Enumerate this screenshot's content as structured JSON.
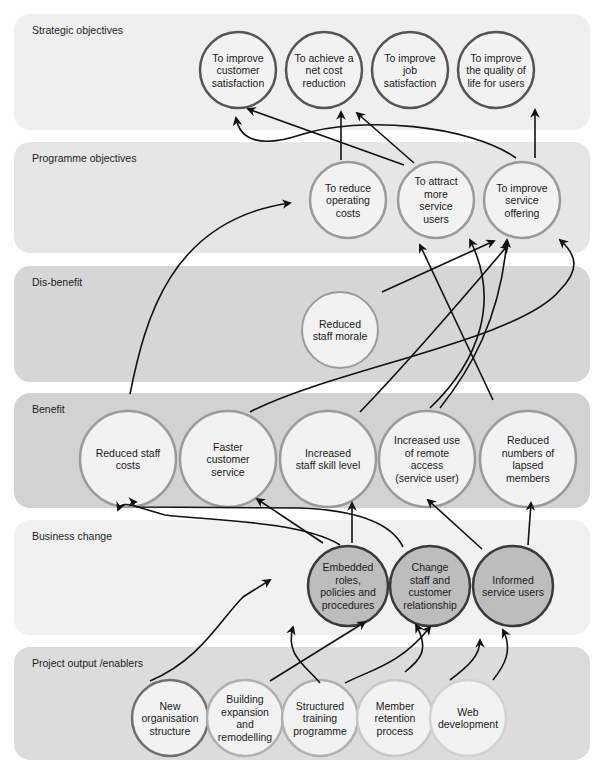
{
  "diagram": {
    "type": "benefits-dependency-network",
    "bands": [
      {
        "id": "strategic",
        "label": "Strategic objectives",
        "y": 14,
        "h": 116,
        "fill": "#efefef"
      },
      {
        "id": "programme",
        "label": "Programme objectives",
        "y": 142,
        "h": 111,
        "fill": "#e6e6e6"
      },
      {
        "id": "disbenefit",
        "label": "Dis-benefit",
        "y": 266,
        "h": 116,
        "fill": "#d6d6d6"
      },
      {
        "id": "benefit",
        "label": "Benefit",
        "y": 393,
        "h": 115,
        "fill": "#d2d2d2"
      },
      {
        "id": "business",
        "label": "Business change",
        "y": 520,
        "h": 115,
        "fill": "#f1f1f1"
      },
      {
        "id": "project",
        "label": "Project output /enablers",
        "y": 647,
        "h": 113,
        "fill": "#dcdcdc"
      }
    ],
    "nodes": [
      {
        "id": "s1",
        "band": "strategic",
        "cx": 238,
        "cy": 70,
        "r": 38,
        "lines": [
          "To improve",
          "customer",
          "satisfaction"
        ],
        "fill": "#f2f2f2",
        "stroke": "#555555",
        "sw": 2.5
      },
      {
        "id": "s2",
        "band": "strategic",
        "cx": 324,
        "cy": 70,
        "r": 38,
        "lines": [
          "To achieve a",
          "net cost",
          "reduction"
        ],
        "fill": "#f2f2f2",
        "stroke": "#555555",
        "sw": 2.5
      },
      {
        "id": "s3",
        "band": "strategic",
        "cx": 410,
        "cy": 70,
        "r": 38,
        "lines": [
          "To improve",
          "job",
          "satisfaction"
        ],
        "fill": "#f2f2f2",
        "stroke": "#555555",
        "sw": 2.5
      },
      {
        "id": "s4",
        "band": "strategic",
        "cx": 496,
        "cy": 70,
        "r": 38,
        "lines": [
          "To improve",
          "the quality of",
          "life for users"
        ],
        "fill": "#f2f2f2",
        "stroke": "#555555",
        "sw": 2.5
      },
      {
        "id": "p1",
        "band": "programme",
        "cx": 348,
        "cy": 200,
        "r": 38,
        "lines": [
          "To reduce",
          "operating",
          "costs"
        ],
        "fill": "#f2f2f2",
        "stroke": "#9a9a9a",
        "sw": 2.5
      },
      {
        "id": "p2",
        "band": "programme",
        "cx": 436,
        "cy": 200,
        "r": 38,
        "lines": [
          "To attract",
          "more",
          "service",
          "users"
        ],
        "fill": "#f2f2f2",
        "stroke": "#9a9a9a",
        "sw": 2.5
      },
      {
        "id": "p3",
        "band": "programme",
        "cx": 522,
        "cy": 200,
        "r": 38,
        "lines": [
          "To improve",
          "service",
          "offering"
        ],
        "fill": "#f2f2f2",
        "stroke": "#9a9a9a",
        "sw": 2.5
      },
      {
        "id": "d1",
        "band": "disbenefit",
        "cx": 340,
        "cy": 330,
        "r": 38,
        "lines": [
          "Reduced",
          "staff morale"
        ],
        "fill": "#f2f2f2",
        "stroke": "#9a9a9a",
        "sw": 2
      },
      {
        "id": "b1",
        "band": "benefit",
        "cx": 128,
        "cy": 459,
        "r": 48,
        "lines": [
          "Reduced staff",
          "costs"
        ],
        "fill": "#f2f2f2",
        "stroke": "#9a9a9a",
        "sw": 2.5
      },
      {
        "id": "b2",
        "band": "benefit",
        "cx": 228,
        "cy": 459,
        "r": 48,
        "lines": [
          "Faster",
          "customer",
          "service"
        ],
        "fill": "#f2f2f2",
        "stroke": "#9a9a9a",
        "sw": 2.5
      },
      {
        "id": "b3",
        "band": "benefit",
        "cx": 328,
        "cy": 459,
        "r": 48,
        "lines": [
          "Increased",
          "staff skill level"
        ],
        "fill": "#f2f2f2",
        "stroke": "#9a9a9a",
        "sw": 2.5
      },
      {
        "id": "b4",
        "band": "benefit",
        "cx": 427,
        "cy": 459,
        "r": 48,
        "lines": [
          "Increased use",
          "of remote",
          "access",
          "(service user)"
        ],
        "fill": "#f2f2f2",
        "stroke": "#9a9a9a",
        "sw": 2.5
      },
      {
        "id": "b5",
        "band": "benefit",
        "cx": 528,
        "cy": 459,
        "r": 48,
        "lines": [
          "Reduced",
          "numbers of",
          "lapsed",
          "members"
        ],
        "fill": "#f2f2f2",
        "stroke": "#9a9a9a",
        "sw": 2.5
      },
      {
        "id": "c1",
        "band": "business",
        "cx": 348,
        "cy": 586,
        "r": 40,
        "lines": [
          "Embedded",
          "roles,",
          "policies and",
          "procedures"
        ],
        "fill": "#bdbdbd",
        "stroke": "#3a3a3a",
        "sw": 2.5
      },
      {
        "id": "c2",
        "band": "business",
        "cx": 430,
        "cy": 586,
        "r": 40,
        "lines": [
          "Change",
          "staff and",
          "customer",
          "relationship"
        ],
        "fill": "#bdbdbd",
        "stroke": "#3a3a3a",
        "sw": 2.5
      },
      {
        "id": "c3",
        "band": "business",
        "cx": 513,
        "cy": 586,
        "r": 40,
        "lines": [
          "Informed",
          "service users"
        ],
        "fill": "#bdbdbd",
        "stroke": "#3a3a3a",
        "sw": 2.5
      },
      {
        "id": "e1",
        "band": "project",
        "cx": 170,
        "cy": 718,
        "r": 38,
        "lines": [
          "New",
          "organisation",
          "structure"
        ],
        "fill": "#f2f2f2",
        "stroke": "#707070",
        "sw": 2.5
      },
      {
        "id": "e2",
        "band": "project",
        "cx": 245,
        "cy": 718,
        "r": 38,
        "lines": [
          "Building",
          "expansion",
          "and",
          "remodelling"
        ],
        "fill": "#f2f2f2",
        "stroke": "#b0b0b0",
        "sw": 2.5
      },
      {
        "id": "e3",
        "band": "project",
        "cx": 320,
        "cy": 718,
        "r": 38,
        "lines": [
          "Structured",
          "training",
          "programme"
        ],
        "fill": "#f2f2f2",
        "stroke": "#b0b0b0",
        "sw": 2.5
      },
      {
        "id": "e4",
        "band": "project",
        "cx": 395,
        "cy": 718,
        "r": 38,
        "lines": [
          "Member",
          "retention",
          "process"
        ],
        "fill": "#f2f2f2",
        "stroke": "#c8c8c8",
        "sw": 2.5
      },
      {
        "id": "e5",
        "band": "project",
        "cx": 468,
        "cy": 718,
        "r": 38,
        "lines": [
          "Web",
          "development"
        ],
        "fill": "#f2f2f2",
        "stroke": "#d2d2d2",
        "sw": 2.5
      }
    ],
    "chevrons": [
      {
        "x": 267,
        "y": 70,
        "w": 14,
        "h": 22,
        "fill": "#5a5a5a"
      },
      {
        "x": 353,
        "y": 70,
        "w": 14,
        "h": 22,
        "fill": "#5a5a5a"
      },
      {
        "x": 439,
        "y": 70,
        "w": 14,
        "h": 22,
        "fill": "#5a5a5a"
      },
      {
        "x": 378,
        "y": 200,
        "w": 14,
        "h": 22,
        "fill": "#8a8a8a"
      },
      {
        "x": 465,
        "y": 200,
        "w": 14,
        "h": 22,
        "fill": "#8a8a8a"
      },
      {
        "x": 164,
        "y": 459,
        "w": 16,
        "h": 26,
        "fill": "#8f8f8f"
      },
      {
        "x": 264,
        "y": 459,
        "w": 16,
        "h": 26,
        "fill": "#8f8f8f"
      },
      {
        "x": 364,
        "y": 459,
        "w": 16,
        "h": 26,
        "fill": "#8f8f8f"
      },
      {
        "x": 463,
        "y": 459,
        "w": 16,
        "h": 26,
        "fill": "#8f8f8f"
      },
      {
        "x": 378,
        "y": 586,
        "w": 14,
        "h": 22,
        "fill": "#222222"
      },
      {
        "x": 460,
        "y": 586,
        "w": 14,
        "h": 22,
        "fill": "#222222"
      },
      {
        "x": 196,
        "y": 718,
        "w": 12,
        "h": 20,
        "fill": "#8a8a8a"
      },
      {
        "x": 271,
        "y": 718,
        "w": 12,
        "h": 20,
        "fill": "#9c9c9c"
      },
      {
        "x": 346,
        "y": 718,
        "w": 12,
        "h": 20,
        "fill": "#b0b0b0"
      },
      {
        "x": 421,
        "y": 718,
        "w": 12,
        "h": 20,
        "fill": "#c4c4c4"
      }
    ],
    "arrows": [
      {
        "from": "p1",
        "to": "s2",
        "d": "M341 160 L341 112"
      },
      {
        "from": "p2",
        "to": "s1",
        "d": "M404 165 L248 109"
      },
      {
        "from": "p2",
        "to": "s3",
        "d": "M414 163 L357 113"
      },
      {
        "from": "p3",
        "to": "s4",
        "d": "M535 158 L535 110"
      },
      {
        "from": "p3",
        "to": "s1",
        "d": "M516 158 C470 125 360 115 300 135 C260 148 240 140 236 118"
      },
      {
        "from": "b1",
        "to": "p1",
        "d": "M130 394 C145 320 170 220 290 203"
      },
      {
        "from": "d1",
        "to": "p3",
        "d": "M382 292 L494 241"
      },
      {
        "from": "b2",
        "to": "p3",
        "d": "M250 412 C330 370 520 340 560 290 C580 270 577 255 560 240"
      },
      {
        "from": "b3",
        "to": "p3",
        "d": "M360 412 C410 360 470 290 508 245"
      },
      {
        "from": "b4",
        "to": "p2",
        "d": "M430 408 C480 360 500 300 470 240"
      },
      {
        "from": "b5",
        "to": "p2",
        "d": "M493 400 L420 245"
      },
      {
        "from": "b4",
        "to": "p3",
        "d": "M440 408 C470 370 500 320 507 240"
      },
      {
        "from": "c1",
        "to": "b1",
        "d": "M340 545 C300 520 200 520 165 515 C130 505 122 500 118 510"
      },
      {
        "from": "c2",
        "to": "b1",
        "d": "M403 547 C390 520 350 510 300 508 L140 507 C130 506 134 502 136 502"
      },
      {
        "from": "c1",
        "to": "b2",
        "d": "M323 543 L257 499"
      },
      {
        "from": "c1",
        "to": "b3",
        "d": "M352 543 L352 503"
      },
      {
        "from": "c3",
        "to": "b4",
        "d": "M482 549 L428 500"
      },
      {
        "from": "c3",
        "to": "b5",
        "d": "M528 545 L531 503"
      },
      {
        "from": "e1",
        "to": "c1",
        "d": "M150 681 C200 660 220 620 243 597 L270 580"
      },
      {
        "from": "e3",
        "to": "c1",
        "d": "M320 683 C305 665 285 655 293 627"
      },
      {
        "from": "e2",
        "to": "c2",
        "d": "M270 681 L365 622"
      },
      {
        "from": "e3",
        "to": "c2",
        "d": "M345 683 C370 670 400 665 430 627"
      },
      {
        "from": "e4",
        "to": "c2",
        "d": "M405 672 C420 660 430 650 416 625"
      },
      {
        "from": "e5",
        "to": "c3",
        "d": "M493 680 C505 665 513 650 503 630"
      },
      {
        "from": "e4",
        "to": "c3",
        "d": "M450 680 C470 665 480 655 480 640"
      }
    ]
  }
}
